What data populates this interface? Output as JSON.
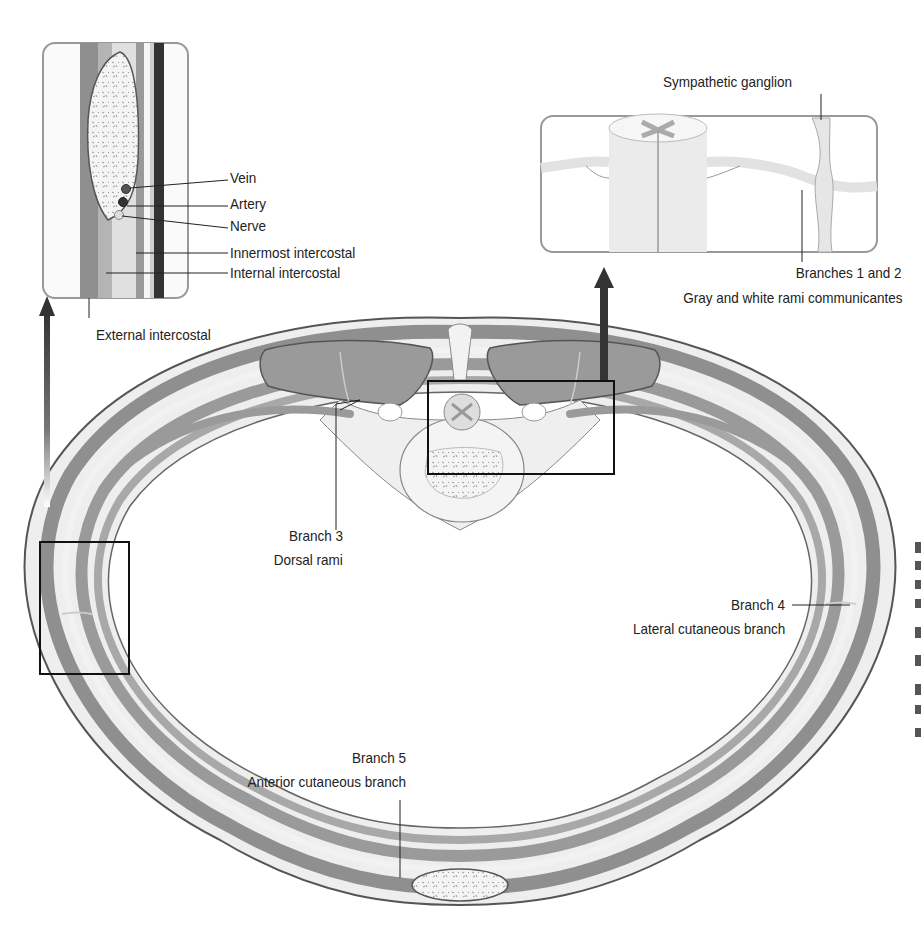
{
  "insets": {
    "intercostal_space": {
      "labels": {
        "vein": "Vein",
        "artery": "Artery",
        "nerve": "Nerve",
        "innermost": "Innermost intercostal",
        "internal": "Internal intercostal",
        "external": "External intercostal"
      }
    },
    "spinal_cord": {
      "labels": {
        "ganglion": "Sympathetic ganglion",
        "branches12": "Branches 1 and 2",
        "rami": "Gray and white rami communicantes"
      }
    }
  },
  "cross_section": {
    "labels": {
      "branch3": "Branch 3",
      "dorsal": "Dorsal rami",
      "branch4": "Branch 4",
      "lateral": "Lateral cutaneous branch",
      "branch5": "Branch 5",
      "anterior": "Anterior cutaneous branch"
    }
  },
  "colors": {
    "muscle_dark": "#8f8f8f",
    "muscle_mid": "#b4b4b4",
    "tissue_light": "#e8e8e8",
    "outline": "#555555",
    "bone": "#f2f2f2",
    "arrow": "#333333"
  }
}
